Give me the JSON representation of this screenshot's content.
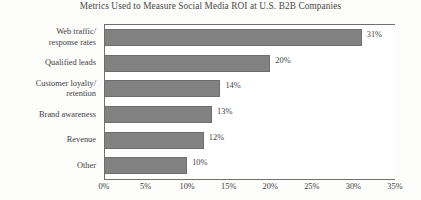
{
  "chart_data": {
    "type": "bar",
    "orientation": "horizontal",
    "title": "Metrics Used to Measure Social Media ROI at U.S. B2B Companies",
    "xlabel": "",
    "ylabel": "",
    "categories": [
      "Web traffic/ response rates",
      "Qualified leads",
      "Customer loyalty/ retention",
      "Brand awareness",
      "Revenue",
      "Other"
    ],
    "category_lines": [
      [
        "Web traffic/",
        "response rates"
      ],
      [
        "Qualified leads"
      ],
      [
        "Customer loyalty/",
        "retention"
      ],
      [
        "Brand awareness"
      ],
      [
        "Revenue"
      ],
      [
        "Other"
      ]
    ],
    "values": [
      31,
      20,
      14,
      13,
      12,
      10
    ],
    "value_labels": [
      "31%",
      "20%",
      "14%",
      "13%",
      "12%",
      "10%"
    ],
    "xlim": [
      0,
      35
    ],
    "xticks": [
      0,
      5,
      10,
      15,
      20,
      25,
      30,
      35
    ],
    "xtick_labels": [
      "0%",
      "5%",
      "10%",
      "15%",
      "20%",
      "25%",
      "30%",
      "35%"
    ],
    "grid": false,
    "legend": null,
    "bar_color": "#828282",
    "bar_border_color": "#6d6d6d",
    "axis_color": "#6f6f6f",
    "text_color": "#3f3f3f",
    "background_color": "#fcfcfb"
  }
}
